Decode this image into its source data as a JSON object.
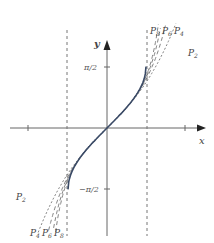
{
  "diagram": {
    "axes": {
      "x_label": "x",
      "y_label": "y",
      "y_ticks": [
        {
          "value": 1.5708,
          "label": "π/2"
        },
        {
          "value": -1.5708,
          "label": "−π/2"
        }
      ],
      "x_ticks": [
        -2,
        2
      ],
      "asymptote_guides_x": [
        -1,
        1
      ]
    },
    "curve": {
      "name": "arcsin x",
      "color": "#3a4a66"
    },
    "approximations": [
      {
        "name": "P",
        "sub": "2",
        "degree": 3,
        "style": "dotted"
      },
      {
        "name": "P",
        "sub": "4",
        "degree": 5,
        "style": "dashed"
      },
      {
        "name": "P",
        "sub": "6",
        "degree": 7,
        "style": "dashed"
      },
      {
        "name": "P",
        "sub": "8",
        "degree": 9,
        "style": "dashed"
      }
    ],
    "labels": {
      "top_right": [
        "P8",
        "P6",
        "P4"
      ],
      "right": "P2",
      "left": "P2",
      "bottom_left": [
        "P4",
        "P6",
        "P8"
      ]
    },
    "colors": {
      "axis": "#666666",
      "curve": "#3a4a66",
      "dash": "#777777"
    }
  }
}
